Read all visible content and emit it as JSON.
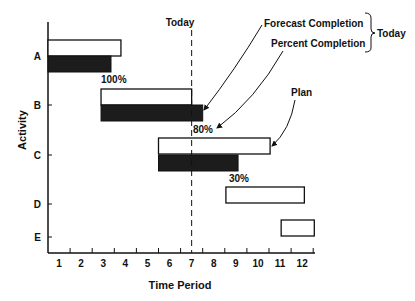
{
  "chart_data": {
    "type": "gantt",
    "title": "",
    "xlabel": "Time Period",
    "ylabel": "Activity",
    "x_ticks": [
      "1",
      "2",
      "3",
      "4",
      "5",
      "6",
      "7",
      "8",
      "9",
      "10",
      "11",
      "12"
    ],
    "xlim": [
      0,
      12
    ],
    "grid": false,
    "today": {
      "label": "Today",
      "x": 6.5
    },
    "activities": [
      {
        "name": "A",
        "plan": [
          0,
          3.3
        ],
        "actual": [
          0,
          2.85
        ],
        "percent_label": "100%"
      },
      {
        "name": "B",
        "plan": [
          2.4,
          6.5
        ],
        "actual": [
          2.4,
          7.0
        ],
        "percent_label": "80%"
      },
      {
        "name": "C",
        "plan": [
          5.0,
          10.05
        ],
        "actual": [
          5.0,
          8.6
        ],
        "percent_label": "30%"
      },
      {
        "name": "D",
        "plan": [
          8.05,
          11.6
        ],
        "actual": null,
        "percent_label": null
      },
      {
        "name": "E",
        "plan": [
          10.55,
          12.05
        ],
        "actual": null,
        "percent_label": null
      }
    ],
    "legend": {
      "forecast_completion": "Forecast Completion",
      "percent_completion": "Percent Completion",
      "brace_label": "Today",
      "plan": "Plan"
    }
  },
  "colors": {
    "ink": "#111111",
    "actual_fill": "#1c1c1c",
    "plan_fill": "#ffffff"
  }
}
